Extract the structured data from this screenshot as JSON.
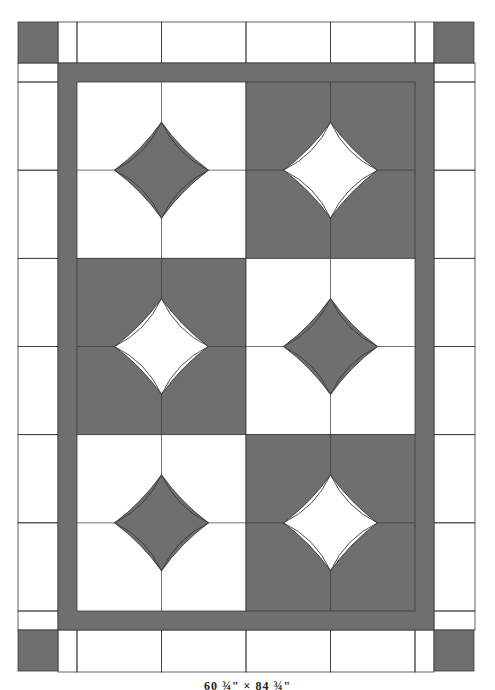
{
  "diagram": {
    "type": "quilt-layout",
    "colors": {
      "dark": "#6f6f6f",
      "light": "#ffffff",
      "line": "#3a3a3a"
    },
    "quilt_bounds": {
      "x": 18,
      "y": 22,
      "w": 457,
      "h": 650
    },
    "inner_border_width": 19,
    "center": {
      "x": 77,
      "y": 82,
      "w": 338,
      "h": 529
    },
    "blocks": {
      "rows": 3,
      "cols": 2,
      "layout": [
        [
          {
            "bg": "light",
            "star": "dark"
          },
          {
            "bg": "dark",
            "star": "light"
          }
        ],
        [
          {
            "bg": "dark",
            "star": "light"
          },
          {
            "bg": "light",
            "star": "dark"
          }
        ],
        [
          {
            "bg": "light",
            "star": "dark"
          },
          {
            "bg": "dark",
            "star": "light"
          }
        ]
      ]
    },
    "outer_border": {
      "top_cells": 4,
      "side_cells": 6,
      "corner": "dark"
    }
  },
  "caption": "60 ¾\" × 84 ¾\""
}
